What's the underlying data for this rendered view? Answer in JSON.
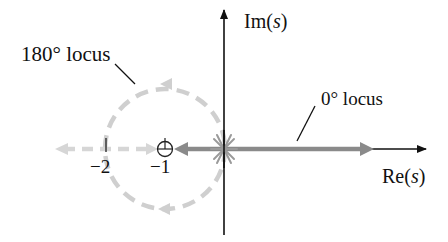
{
  "diagram": {
    "type": "root-locus",
    "axes": {
      "real_axis_label": "Re",
      "real_axis_var": "s",
      "imag_axis_label": "Im",
      "imag_axis_var": "s"
    },
    "ticks": [
      {
        "label": "−2",
        "value": -2
      },
      {
        "label": "−1",
        "value": -1
      }
    ],
    "annotations": {
      "locus_180_label": "180° locus",
      "locus_0_label": "0° locus"
    },
    "poles": {
      "location": 0,
      "count": 3,
      "marker": "x-marker-icon"
    },
    "zeros": [
      {
        "location": -1,
        "marker": "circle-zero-icon"
      }
    ],
    "colors": {
      "axis": "#111111",
      "locus_0": "#8a8a8a",
      "locus_180": "#cfcfcf",
      "pole_marker": "#9a9a9a",
      "text": "#111111"
    }
  }
}
